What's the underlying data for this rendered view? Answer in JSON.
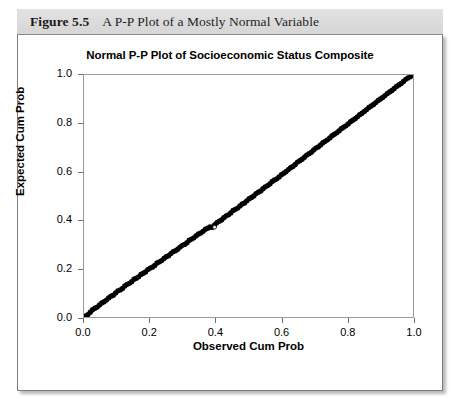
{
  "figure": {
    "number": "Figure 5.5",
    "caption": "A P-P Plot of a Mostly Normal Variable"
  },
  "chart_data": {
    "type": "scatter",
    "title": "Normal P-P Plot of Socioeconomic Status Composite",
    "xlabel": "Observed Cum Prob",
    "ylabel": "Expected Cum Prob",
    "xlim": [
      0.0,
      1.0
    ],
    "ylim": [
      0.0,
      1.0
    ],
    "xticks": [
      "0.0",
      "0.2",
      "0.4",
      "0.6",
      "0.8",
      "1.0"
    ],
    "yticks": [
      "0.0",
      "0.2",
      "0.4",
      "0.6",
      "0.8",
      "1.0"
    ],
    "xtick_values": [
      0.0,
      0.2,
      0.4,
      0.6,
      0.8,
      1.0
    ],
    "ytick_values": [
      0.0,
      0.2,
      0.4,
      0.6,
      0.8,
      1.0
    ],
    "grid": false,
    "legend": false,
    "marker": "open-circle",
    "marker_color": "#000000",
    "series": [
      {
        "name": "Socioeconomic Status Composite",
        "x": [
          0.005,
          0.012,
          0.019,
          0.026,
          0.033,
          0.04,
          0.047,
          0.054,
          0.061,
          0.068,
          0.075,
          0.082,
          0.089,
          0.096,
          0.103,
          0.11,
          0.117,
          0.124,
          0.131,
          0.138,
          0.145,
          0.152,
          0.159,
          0.166,
          0.173,
          0.18,
          0.187,
          0.194,
          0.201,
          0.208,
          0.215,
          0.222,
          0.229,
          0.236,
          0.243,
          0.25,
          0.257,
          0.264,
          0.271,
          0.278,
          0.285,
          0.292,
          0.299,
          0.306,
          0.313,
          0.32,
          0.327,
          0.334,
          0.341,
          0.348,
          0.355,
          0.362,
          0.369,
          0.376,
          0.383,
          0.39,
          0.397,
          0.404,
          0.411,
          0.418,
          0.425,
          0.432,
          0.439,
          0.446,
          0.453,
          0.46,
          0.467,
          0.474,
          0.481,
          0.488,
          0.495,
          0.502,
          0.509,
          0.516,
          0.523,
          0.53,
          0.537,
          0.544,
          0.551,
          0.558,
          0.565,
          0.572,
          0.579,
          0.586,
          0.593,
          0.6,
          0.607,
          0.614,
          0.621,
          0.628,
          0.635,
          0.642,
          0.649,
          0.656,
          0.663,
          0.67,
          0.677,
          0.684,
          0.691,
          0.698,
          0.705,
          0.712,
          0.719,
          0.726,
          0.733,
          0.74,
          0.747,
          0.754,
          0.761,
          0.768,
          0.775,
          0.782,
          0.789,
          0.796,
          0.803,
          0.81,
          0.817,
          0.824,
          0.831,
          0.838,
          0.845,
          0.852,
          0.859,
          0.866,
          0.873,
          0.88,
          0.887,
          0.894,
          0.901,
          0.908,
          0.915,
          0.922,
          0.929,
          0.936,
          0.943,
          0.95,
          0.957,
          0.964,
          0.971,
          0.978,
          0.985,
          0.992,
          0.998
        ],
        "y": [
          0.004,
          0.01,
          0.02,
          0.03,
          0.036,
          0.041,
          0.05,
          0.058,
          0.063,
          0.07,
          0.079,
          0.086,
          0.09,
          0.099,
          0.108,
          0.112,
          0.118,
          0.128,
          0.135,
          0.139,
          0.146,
          0.156,
          0.16,
          0.166,
          0.176,
          0.181,
          0.186,
          0.196,
          0.202,
          0.206,
          0.213,
          0.223,
          0.228,
          0.233,
          0.242,
          0.249,
          0.253,
          0.262,
          0.27,
          0.274,
          0.28,
          0.289,
          0.296,
          0.3,
          0.307,
          0.317,
          0.322,
          0.327,
          0.336,
          0.343,
          0.347,
          0.354,
          0.363,
          0.367,
          0.372,
          0.371,
          0.38,
          0.39,
          0.396,
          0.401,
          0.41,
          0.418,
          0.422,
          0.43,
          0.44,
          0.445,
          0.45,
          0.459,
          0.467,
          0.471,
          0.48,
          0.489,
          0.494,
          0.5,
          0.51,
          0.516,
          0.521,
          0.53,
          0.538,
          0.543,
          0.55,
          0.56,
          0.566,
          0.571,
          0.579,
          0.588,
          0.594,
          0.6,
          0.609,
          0.617,
          0.622,
          0.63,
          0.64,
          0.646,
          0.652,
          0.66,
          0.669,
          0.675,
          0.681,
          0.69,
          0.698,
          0.703,
          0.711,
          0.72,
          0.726,
          0.732,
          0.74,
          0.749,
          0.755,
          0.761,
          0.769,
          0.778,
          0.784,
          0.79,
          0.798,
          0.807,
          0.813,
          0.819,
          0.827,
          0.836,
          0.842,
          0.849,
          0.857,
          0.866,
          0.872,
          0.878,
          0.886,
          0.895,
          0.901,
          0.907,
          0.915,
          0.924,
          0.93,
          0.936,
          0.944,
          0.953,
          0.959,
          0.965,
          0.973,
          0.982,
          0.988,
          0.993,
          1.0
        ]
      }
    ],
    "reference_point": {
      "x": 0.397,
      "y": 0.371,
      "style": "hollow"
    }
  }
}
